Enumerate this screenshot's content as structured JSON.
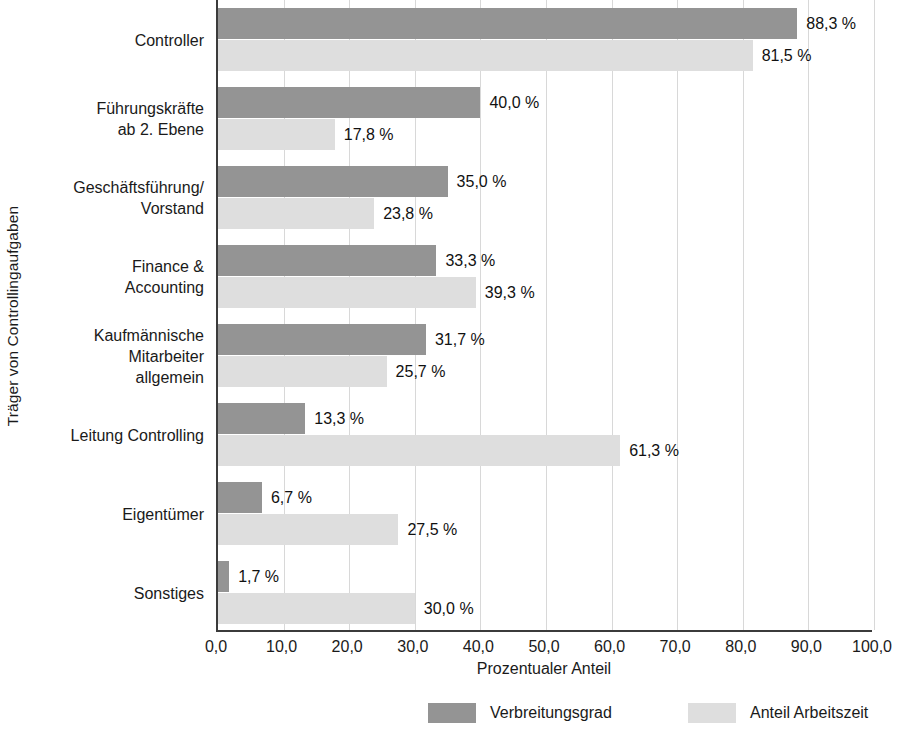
{
  "chart_data": {
    "type": "bar",
    "orientation": "horizontal",
    "title": "",
    "xlabel": "Prozentualer Anteil",
    "ylabel": "Träger von Controllingaufgaben",
    "xlim": [
      0,
      100
    ],
    "grid": true,
    "legend_position": "bottom",
    "categories": [
      "Controller",
      "Führungskräfte\nab 2. Ebene",
      "Geschäftsführung/\nVorstand",
      "Finance &\nAccounting",
      "Kaufmännische\nMitarbeiter\nallgemein",
      "Leitung Controlling",
      "Eigentümer",
      "Sonstiges"
    ],
    "series": [
      {
        "name": "Verbreitungsgrad",
        "color": "#949494",
        "values": [
          88.3,
          40.0,
          35.0,
          33.3,
          31.7,
          13.3,
          6.7,
          1.7
        ],
        "labels": [
          "88,3 %",
          "40,0 %",
          "35,0 %",
          "33,3 %",
          "31,7 %",
          "13,3 %",
          "6,7 %",
          "1,7 %"
        ]
      },
      {
        "name": "Anteil Arbeitszeit",
        "color": "#dedede",
        "values": [
          81.5,
          17.8,
          23.8,
          39.3,
          25.7,
          61.3,
          27.5,
          30.0
        ],
        "labels": [
          "81,5 %",
          "17,8 %",
          "23,8 %",
          "39,3 %",
          "25,7 %",
          "61,3 %",
          "27,5 %",
          "30,0 %"
        ]
      }
    ],
    "xticks": [
      0,
      10,
      20,
      30,
      40,
      50,
      60,
      70,
      80,
      90,
      100
    ],
    "xtick_labels": [
      "0,0",
      "10,0",
      "20,0",
      "30,0",
      "40,0",
      "50,0",
      "60,0",
      "70,0",
      "80,0",
      "90,0",
      "100,0"
    ]
  },
  "legend": {
    "items": [
      {
        "label": "Verbreitungsgrad"
      },
      {
        "label": "Anteil Arbeitszeit"
      }
    ]
  }
}
